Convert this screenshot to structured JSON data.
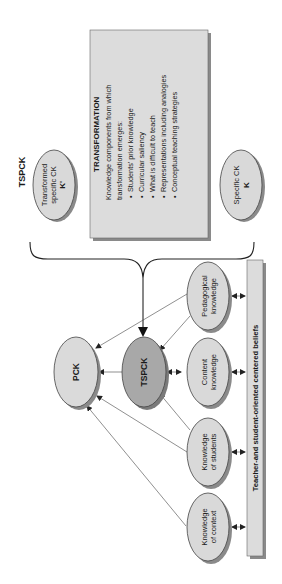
{
  "diagram": {
    "top_label": "TSPCK",
    "transformed_ck": {
      "line1": "Transformed",
      "line2": "specific CK",
      "symbol": "K'"
    },
    "specific_ck": {
      "line1": "Specific CK",
      "symbol": "K"
    },
    "transformation_box": {
      "title": "TRANSFORMATION",
      "intro_line1": "Knowledge components from which",
      "intro_line2": "transformation emerges:",
      "items": [
        "Students' prior knowledge",
        "Curricular saliency",
        "What is difficult to teach",
        "Representations including analogies",
        "Conceptual teaching strategies"
      ]
    },
    "pck": {
      "label": "PCK"
    },
    "tspck": {
      "label": "TSPCK"
    },
    "knowledge_nodes": [
      {
        "line1": "Pedagogical",
        "line2": "knowledge"
      },
      {
        "line1": "Content",
        "line2": "knowledge"
      },
      {
        "line1": "Knowledge",
        "line2": "of students"
      },
      {
        "line1": "Knowledge",
        "line2": "of context"
      }
    ],
    "beliefs_bar": {
      "label": "Teacher-and student-oriented centered beliefs"
    },
    "colors": {
      "ellipse_fill": "#d9d9d9",
      "tspck_fill": "#a8a8a8",
      "box_fill": "#dcdcdc",
      "shadow": "#8a8a8a",
      "stroke": "#333333"
    }
  }
}
